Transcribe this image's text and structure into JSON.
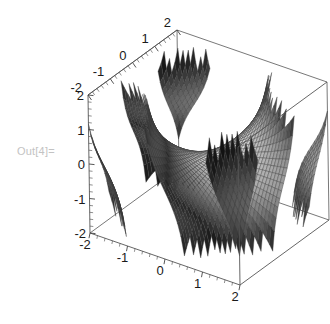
{
  "notebook": {
    "out_label": "Out[4]=",
    "out_label_color": "#c3c3c3",
    "background": "#ffffff"
  },
  "chart_data": {
    "type": "surface3d",
    "title": "",
    "xlabel": "",
    "ylabel": "",
    "zlabel": "",
    "grid": true,
    "legend": null,
    "colorscheme": "grayscale",
    "surface_fill_light": "#d0d0d0",
    "surface_fill_mid": "#9a9a9a",
    "surface_fill_dark": "#2b2b2b",
    "mesh_line_color": "#3a3a3a",
    "box_line_color": "#555555",
    "xlim": [
      -2,
      2
    ],
    "ylim": [
      -2,
      2
    ],
    "zlim": [
      -2,
      2
    ],
    "xticks": [
      -2,
      -1,
      0,
      1,
      2
    ],
    "yticks": [
      -2,
      -1,
      0,
      1,
      2
    ],
    "zticks": [
      -2,
      -1,
      0,
      1,
      2
    ],
    "xtick_labels": [
      "-2",
      "-1",
      "0",
      "1",
      "2"
    ],
    "ytick_labels": [
      "-2",
      "-1",
      "0",
      "1",
      "2"
    ],
    "ztick_labels": [
      "-2",
      "-1",
      "0",
      "1",
      "2"
    ],
    "minor_ticks_per_interval": 5,
    "function": "tan(x*y)",
    "clip_z": [
      -2,
      2
    ],
    "samples": 46,
    "view": {
      "theta_deg": 28,
      "phi_deg": 22,
      "projection": "oblique-axonometric"
    },
    "box_corners_px": {
      "left": [
        88,
        95
      ],
      "top": [
        177,
        30
      ],
      "right": [
        310,
        70
      ],
      "front_bottom": [
        240,
        285
      ],
      "left_bottom": [
        90,
        233
      ]
    }
  },
  "axes": {
    "top_axis_name": "y-axis-top",
    "left_axis_name": "z-axis-left",
    "bottom_axis_name": "x-axis-bottom"
  }
}
